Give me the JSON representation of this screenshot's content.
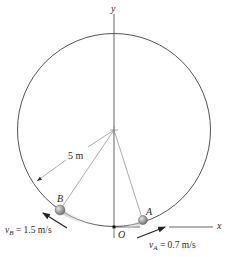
{
  "figure": {
    "type": "physics-diagram",
    "colors": {
      "line": "#555555",
      "thin_line": "#8a8a8a",
      "ball": "#a8a8a8",
      "arrow": "#222222",
      "text": "#2a2a2a"
    },
    "axes": {
      "y_label": "y",
      "x_label": "x",
      "origin_label": "O"
    },
    "radius": {
      "label": "5 m"
    },
    "ball_A": {
      "label": "A",
      "velocity_symbol": "v",
      "velocity_subscript": "A",
      "velocity_value": " = 0.7 m/s"
    },
    "ball_B": {
      "label": "B",
      "velocity_symbol": "v",
      "velocity_subscript": "B",
      "velocity_value": " = 1.5 m/s"
    }
  }
}
